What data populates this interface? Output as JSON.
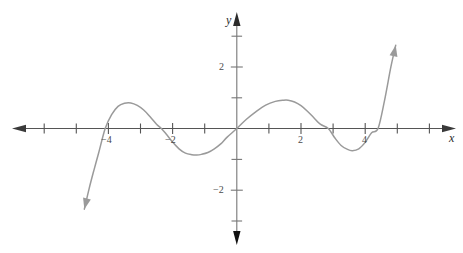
{
  "chart_data": {
    "type": "line",
    "title": "",
    "subtitle": "",
    "xlabel": "x",
    "ylabel": "y",
    "xlim": [
      -6.85,
      6.65
    ],
    "ylim": [
      -3.6,
      3.6
    ],
    "grid": false,
    "legend": null,
    "axis_style": {
      "x_axis_arrows": [
        "left",
        "right"
      ],
      "y_axis_arrows": [
        "up",
        "down"
      ],
      "tick_interval": 1,
      "labeled_x_ticks": [
        -4,
        -2,
        2,
        4
      ],
      "labeled_y_ticks": [
        2,
        -2
      ]
    },
    "x_tick_labels": [
      "−4",
      "−2",
      "2",
      "4"
    ],
    "y_tick_labels": [
      "2",
      "−2"
    ],
    "series": [
      {
        "name": "curve",
        "color": "#9a9a9a",
        "start_arrow": true,
        "end_arrow": true,
        "x_zeros": [
          -4.1,
          -2.35,
          0,
          2.85,
          4.4
        ],
        "local_maxima": [
          {
            "x": -3.3,
            "y": 0.82
          },
          {
            "x": 1.6,
            "y": 0.92
          }
        ],
        "local_minima": [
          {
            "x": -1.25,
            "y": -0.85
          },
          {
            "x": 3.6,
            "y": -0.72
          }
        ],
        "x": [
          -4.75,
          -4.6,
          -4.45,
          -4.3,
          -4.1,
          -3.9,
          -3.7,
          -3.5,
          -3.3,
          -3.1,
          -2.9,
          -2.7,
          -2.5,
          -2.35,
          -2.2,
          -2.0,
          -1.8,
          -1.6,
          -1.4,
          -1.25,
          -1.1,
          -0.9,
          -0.7,
          -0.5,
          -0.3,
          0.0,
          0.3,
          0.6,
          0.9,
          1.2,
          1.45,
          1.6,
          1.8,
          2.0,
          2.2,
          2.4,
          2.6,
          2.85,
          3.05,
          3.25,
          3.45,
          3.6,
          3.8,
          4.0,
          4.2,
          4.4,
          4.6,
          4.8,
          4.95
        ],
        "y": [
          -2.62,
          -1.95,
          -1.35,
          -0.78,
          0.0,
          0.45,
          0.72,
          0.82,
          0.83,
          0.75,
          0.6,
          0.38,
          0.14,
          0.0,
          -0.18,
          -0.44,
          -0.66,
          -0.8,
          -0.85,
          -0.86,
          -0.84,
          -0.78,
          -0.66,
          -0.5,
          -0.28,
          0.0,
          0.3,
          0.55,
          0.76,
          0.88,
          0.92,
          0.92,
          0.86,
          0.74,
          0.56,
          0.35,
          0.14,
          0.0,
          -0.3,
          -0.55,
          -0.68,
          -0.72,
          -0.66,
          -0.45,
          -0.14,
          0.0,
          0.9,
          2.0,
          2.7
        ]
      }
    ]
  },
  "labels": {
    "x_axis": "x",
    "y_axis": "y",
    "x_neg4": "−4",
    "x_neg2": "−2",
    "x_pos2": "2",
    "x_pos4": "4",
    "y_pos2": "2",
    "y_neg2": "−2"
  },
  "colors": {
    "curve": "#9a9a9a",
    "axis": "#555555",
    "text": "#3a3a3a",
    "background": "#ffffff"
  }
}
